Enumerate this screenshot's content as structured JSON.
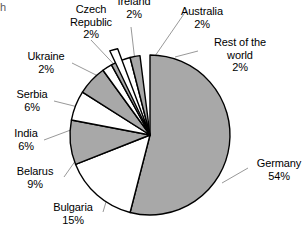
{
  "chart_data": {
    "type": "pie",
    "title": "",
    "subtitle": "",
    "xlabel": "",
    "ylabel": "",
    "grid": false,
    "legend_position": "none",
    "value_unit": "%",
    "total": 100,
    "start_angle_deg": 0,
    "direction": "clockwise",
    "categories": [
      "Germany",
      "Bulgaria",
      "Belarus",
      "India",
      "Serbia",
      "Ukraine",
      "Czech Republic",
      "Ireland",
      "Australia",
      "Rest of the world"
    ],
    "values": [
      54,
      15,
      9,
      6,
      6,
      2,
      2,
      2,
      2,
      2
    ],
    "slices": [
      {
        "label": "Germany",
        "value": 54,
        "value_text": "54%",
        "fill": "#a8a8a8"
      },
      {
        "label": "Bulgaria",
        "value": 15,
        "value_text": "15%",
        "fill": "#ffffff"
      },
      {
        "label": "Belarus",
        "value": 9,
        "value_text": "9%",
        "fill": "#a8a8a8"
      },
      {
        "label": "India",
        "value": 6,
        "value_text": "6%",
        "fill": "#ffffff"
      },
      {
        "label": "Serbia",
        "value": 6,
        "value_text": "6%",
        "fill": "#a8a8a8"
      },
      {
        "label": "Ukraine",
        "value": 2,
        "value_text": "2%",
        "fill": "#ffffff"
      },
      {
        "label": "Czech Republic",
        "value": 2,
        "value_text": "2%",
        "fill": "#a8a8a8"
      },
      {
        "label": "Ireland",
        "value": 2,
        "value_text": "2%",
        "fill": "#ffffff"
      },
      {
        "label": "Australia",
        "value": 2,
        "value_text": "2%",
        "fill": "#a8a8a8"
      },
      {
        "label": "Rest of the world",
        "value": 2,
        "value_text": "2%",
        "fill": "#ffffff"
      }
    ]
  },
  "colors": {
    "slice_gray": "#a8a8a8",
    "slice_white": "#ffffff",
    "outline": "#000000",
    "leader_line": "#8c8c8c",
    "text": "#000000",
    "background": "#ffffff"
  },
  "labels": {
    "czech_republic": {
      "line1": "Czech",
      "line2": "Republic",
      "value": "2%"
    },
    "ireland": {
      "name": "Ireland",
      "value": "2%"
    },
    "australia": {
      "name": "Australia",
      "value": "2%"
    },
    "rest_of_world": {
      "line1": "Rest of the",
      "line2": "world",
      "value": "2%"
    },
    "ukraine": {
      "name": "Ukraine",
      "value": "2%"
    },
    "serbia": {
      "name": "Serbia",
      "value": "6%"
    },
    "india": {
      "name": "India",
      "value": "6%"
    },
    "belarus": {
      "name": "Belarus",
      "value": "9%"
    },
    "bulgaria": {
      "name": "Bulgaria",
      "value": "15%"
    },
    "germany": {
      "name": "Germany",
      "value": "54%"
    },
    "clipped_edge_glyph": "h"
  }
}
